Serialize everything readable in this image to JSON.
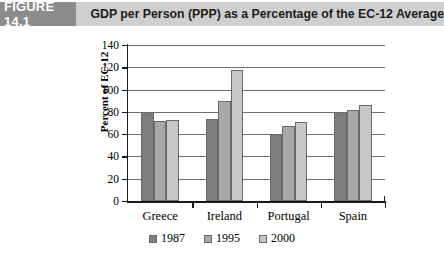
{
  "header": {
    "tab_label": "FIGURE 14.1",
    "title": "GDP per Person (PPP) as a Percentage of the EC-12 Average",
    "tab_bg": "#8c8c8c",
    "band_bg": "#cfcfcf"
  },
  "chart_data": {
    "type": "bar",
    "title": "GDP per Person (PPP) as a Percentage of the EC-12 Average",
    "xlabel": "",
    "ylabel": "Percent of EC-12",
    "categories": [
      "Greece",
      "Ireland",
      "Portugal",
      "Spain"
    ],
    "series": [
      {
        "name": "1987",
        "color": "#7d7d7d",
        "values": [
          80,
          74,
          60,
          80
        ]
      },
      {
        "name": "1995",
        "color": "#a8a8a8",
        "values": [
          72,
          90,
          67,
          82
        ]
      },
      {
        "name": "2000",
        "color": "#c6c6c6",
        "values": [
          73,
          118,
          71,
          86
        ]
      }
    ],
    "ylim": [
      0,
      140
    ],
    "yticks": [
      0,
      20,
      40,
      60,
      80,
      100,
      120,
      140
    ],
    "ytick_labels": [
      "0",
      "20",
      "40",
      "60",
      "80",
      "100",
      "120",
      "140"
    ],
    "grid": true,
    "legend_position": "bottom"
  }
}
